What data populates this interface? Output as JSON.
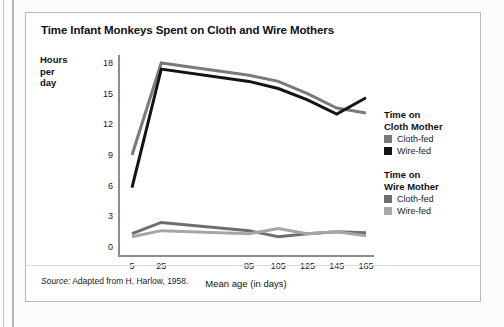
{
  "figure": {
    "title": "Time Infant Monkeys Spent on Cloth and Wire Mothers",
    "source_prefix": "Source:",
    "source_text": " Adapted from H. Harlow, 1958."
  },
  "legend": {
    "groups": [
      {
        "heading_line1": "Time on",
        "heading_line2": "Cloth Mother",
        "items": [
          {
            "label": "Cloth-fed",
            "color": "#7a7a7a"
          },
          {
            "label": "Wire-fed",
            "color": "#141414"
          }
        ]
      },
      {
        "heading_line1": "Time on",
        "heading_line2": "Wire Mother",
        "items": [
          {
            "label": "Cloth-fed",
            "color": "#6e6e6e"
          },
          {
            "label": "Wire-fed",
            "color": "#a6a6a6"
          }
        ]
      }
    ]
  },
  "chart_data": {
    "type": "line",
    "title": "Time Infant Monkeys Spent on Cloth and Wire Mothers",
    "xlabel": "Mean age (in days)",
    "ylabel": "Hours per day",
    "ylabel_lines": [
      "Hours",
      "per",
      "day"
    ],
    "xlim": [
      5,
      165
    ],
    "ylim": [
      0,
      18
    ],
    "yticks": [
      0,
      3,
      6,
      9,
      12,
      15,
      18
    ],
    "xticks": [
      5,
      25,
      85,
      105,
      125,
      145,
      165
    ],
    "x": [
      5,
      25,
      85,
      105,
      125,
      145,
      165
    ],
    "grid": false,
    "legend_position": "right",
    "series": [
      {
        "name": "Time on Cloth Mother - Cloth-fed",
        "color": "#7a7a7a",
        "values": [
          9.0,
          18.0,
          16.8,
          16.2,
          15.0,
          13.6,
          13.1
        ]
      },
      {
        "name": "Time on Cloth Mother - Wire-fed",
        "color": "#141414",
        "values": [
          5.8,
          17.4,
          16.2,
          15.5,
          14.4,
          13.0,
          14.6
        ]
      },
      {
        "name": "Time on Wire Mother - Cloth-fed",
        "color": "#6e6e6e",
        "values": [
          1.3,
          2.4,
          1.6,
          1.0,
          1.3,
          1.5,
          1.4
        ]
      },
      {
        "name": "Time on Wire Mother - Wire-fed",
        "color": "#a6a6a6",
        "values": [
          1.0,
          1.6,
          1.3,
          1.8,
          1.3,
          1.5,
          1.1
        ]
      }
    ]
  }
}
